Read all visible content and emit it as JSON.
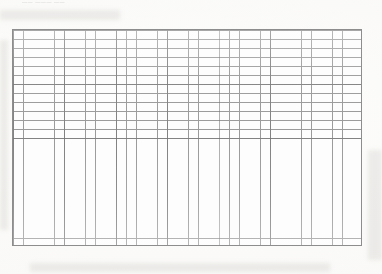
{
  "document": {
    "type": "graph-paper-scan",
    "header_text": "—— ——— ——",
    "paper_color": "#fdfdfc",
    "grid_line_color": "#9a9a9a",
    "grid_emphasis_color": "#6e6e6e",
    "grid_border_color": "#8d8d8d"
  },
  "grid": {
    "columns": 34,
    "rows": 24,
    "cell_width_px": 10.29,
    "cell_height_px": 9.04,
    "emphasis_every_columns": 5,
    "emphasis_every_rows": 6,
    "left_px": 12,
    "top_px": 29,
    "width_px": 350,
    "height_px": 217
  }
}
